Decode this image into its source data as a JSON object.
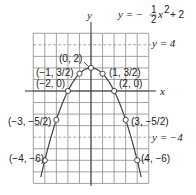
{
  "chart_data": {
    "type": "line",
    "equation": {
      "lhs": "y = −",
      "frac_num": "1",
      "frac_den": "2",
      "rhs_var": "x",
      "rhs_exp": "2",
      "rhs_tail": "+ 2"
    },
    "xlabel": "x",
    "ylabel": "y",
    "xlim": [
      -5,
      5
    ],
    "ylim": [
      -8,
      5
    ],
    "grid": true,
    "series": [
      {
        "name": "y = -1/2 x^2 + 2",
        "x": [
          -4,
          -3,
          -2,
          -1,
          0,
          1,
          2,
          3,
          4
        ],
        "y": [
          -6,
          -2.5,
          0,
          1.5,
          2,
          1.5,
          0,
          -2.5,
          -6
        ]
      }
    ],
    "points": [
      {
        "x": 0,
        "y": 2,
        "label": "(0, 2)"
      },
      {
        "x": -1,
        "y": 1.5,
        "label": "(−1, 3/2)"
      },
      {
        "x": 1,
        "y": 1.5,
        "label": "(1, 3/2)"
      },
      {
        "x": -2,
        "y": 0,
        "label": "(−2, 0)"
      },
      {
        "x": 2,
        "y": 0,
        "label": "(2, 0)"
      },
      {
        "x": -3,
        "y": -2.5,
        "label": "(−3, −5/2)"
      },
      {
        "x": 3,
        "y": -2.5,
        "label": "(3, −5/2)"
      },
      {
        "x": -4,
        "y": -6,
        "label": "(−4, −6)"
      },
      {
        "x": 4,
        "y": -6,
        "label": "(4, −6)"
      }
    ],
    "reference_lines": [
      {
        "y": 4,
        "label": "y = 4",
        "style": "dashed"
      },
      {
        "y": -4,
        "label": "y = −4",
        "style": "dashed"
      }
    ]
  },
  "labels": {
    "vertex": "(0, 2)",
    "p_m1": "(−1, 3/2)",
    "p_1": "(1, 3/2)",
    "p_m2": "(−2, 0)",
    "p_2": "(2, 0)",
    "p_m3": "(−3, −5/2)",
    "p_3": "(3, −5/2)",
    "p_m4": "(−4, −6)",
    "p_4": "(4, −6)",
    "y4": "y = 4",
    "ym4": "y = −4",
    "x_axis": "x",
    "y_axis": "y"
  }
}
